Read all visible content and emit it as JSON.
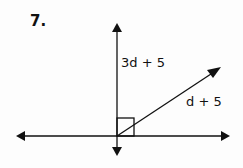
{
  "problem": {
    "number": "7.",
    "angle_labels": {
      "upper": "3d + 5",
      "lower": "d + 5"
    },
    "right_angle_marker": true
  },
  "colors": {
    "ink": "#111111",
    "background": "#fdfdfd"
  }
}
